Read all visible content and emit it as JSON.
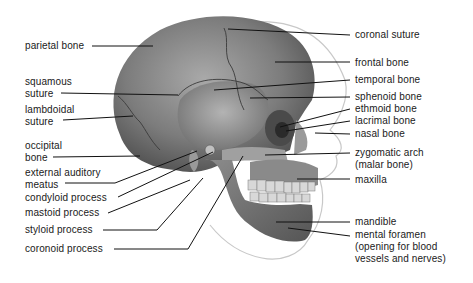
{
  "figure": {
    "labels_left": [
      {
        "id": "parietal",
        "text": "parietal bone",
        "x": 25,
        "y": 39
      },
      {
        "id": "squamous",
        "text": "squamous\nsuture",
        "x": 25,
        "y": 76
      },
      {
        "id": "lambdoidal",
        "text": "lambdoidal\nsuture",
        "x": 25,
        "y": 104
      },
      {
        "id": "occipital",
        "text": "occipital\nbone",
        "x": 25,
        "y": 140
      },
      {
        "id": "auditory",
        "text": "external auditory\nmeatus",
        "x": 25,
        "y": 168
      },
      {
        "id": "condyloid",
        "text": "condyloid process",
        "x": 25,
        "y": 193
      },
      {
        "id": "mastoid",
        "text": "mastoid process",
        "x": 25,
        "y": 208
      },
      {
        "id": "styloid",
        "text": "styloid process",
        "x": 25,
        "y": 225
      },
      {
        "id": "coronoid",
        "text": "coronoid process",
        "x": 25,
        "y": 243
      }
    ],
    "labels_right": [
      {
        "id": "coronal",
        "text": "coronal suture",
        "x": 355,
        "y": 29
      },
      {
        "id": "frontal",
        "text": "frontal bone",
        "x": 355,
        "y": 57
      },
      {
        "id": "temporal",
        "text": "temporal bone",
        "x": 355,
        "y": 75
      },
      {
        "id": "sphenoid",
        "text": "sphenoid bone",
        "x": 355,
        "y": 92
      },
      {
        "id": "ethmoid",
        "text": "ethmoid bone",
        "x": 355,
        "y": 104
      },
      {
        "id": "lacrimal",
        "text": "lacrimal bone",
        "x": 355,
        "y": 116
      },
      {
        "id": "nasal",
        "text": "nasal bone",
        "x": 355,
        "y": 129
      },
      {
        "id": "zygomatic",
        "text": "zygomatic arch\n(malar bone)",
        "x": 355,
        "y": 148
      },
      {
        "id": "maxilla",
        "text": "maxilla",
        "x": 355,
        "y": 175
      },
      {
        "id": "mandible",
        "text": "mandible",
        "x": 355,
        "y": 216
      },
      {
        "id": "mental",
        "text": "mental foramen\n(opening for blood\nvessels and nerves)",
        "x": 355,
        "y": 230
      }
    ]
  },
  "colors": {
    "skull_dark": "#5e5e5e",
    "skull_mid": "#8a8a8a",
    "skull_light": "#bdbdbd",
    "leader": "#111111",
    "text": "#1a1a1a"
  }
}
